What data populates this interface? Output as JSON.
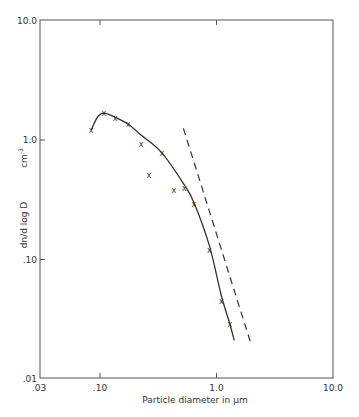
{
  "chart_data": {
    "type": "scatter",
    "title": "",
    "xlabel": "Particle diameter in μm",
    "ylabel": "dn/d log D",
    "ylabel_units": "cm⁻³",
    "x_scale": "log",
    "y_scale": "log",
    "xlim": [
      0.03,
      10.0
    ],
    "ylim": [
      0.01,
      10.0
    ],
    "x_ticks": [
      0.03,
      0.1,
      1.0,
      10.0
    ],
    "x_tick_labels": [
      ".03",
      ".10",
      "1.0",
      "10.0"
    ],
    "y_ticks": [
      0.01,
      0.1,
      1.0,
      10.0
    ],
    "y_tick_labels": [
      ".01",
      ".10",
      "1.0",
      "10.0"
    ],
    "grid": false,
    "legend": null,
    "series": [
      {
        "name": "Measured",
        "style": "x-markers",
        "x": [
          0.084,
          0.108,
          0.135,
          0.174,
          0.225,
          0.263,
          0.34,
          0.43,
          0.53,
          0.64,
          0.87,
          1.1,
          1.3
        ],
        "y": [
          1.21,
          1.68,
          1.53,
          1.36,
          0.93,
          0.51,
          0.78,
          0.38,
          0.4,
          0.29,
          0.12,
          0.045,
          0.029
        ]
      },
      {
        "name": "Fitted curve",
        "style": "solid-line",
        "x": [
          0.084,
          0.095,
          0.108,
          0.135,
          0.174,
          0.225,
          0.34,
          0.53,
          0.64,
          0.87,
          1.1,
          1.3,
          1.42
        ],
        "y": [
          1.21,
          1.55,
          1.68,
          1.55,
          1.36,
          1.1,
          0.78,
          0.42,
          0.3,
          0.13,
          0.05,
          0.029,
          0.021
        ]
      },
      {
        "name": "Reference slope",
        "style": "dashed-line",
        "x": [
          0.52,
          2.0
        ],
        "y": [
          1.25,
          0.019
        ]
      }
    ]
  },
  "axes": {
    "x_title": "Particle diameter in μm",
    "y_title": "dn/d log D",
    "y_units": "cm",
    "y_units_exp": "-3",
    "x_tick_labels": [
      ".03",
      ".10",
      "1.0",
      "10.0"
    ],
    "y_tick_labels": [
      ".01",
      ".10",
      "1.0",
      "10.0"
    ]
  }
}
